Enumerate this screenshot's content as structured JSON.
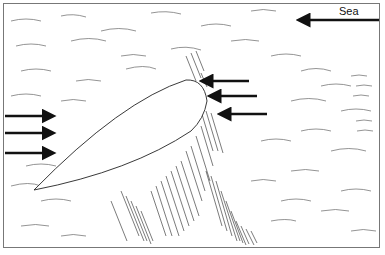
{
  "diagram": {
    "label": "Sea",
    "elements": [
      {
        "name": "hull",
        "shape": "streamlined bow outline, pointing upper-right"
      },
      {
        "name": "sea-arrow",
        "direction": "left",
        "position": "top-right"
      },
      {
        "name": "bow-arrows",
        "count": 3,
        "direction": "left",
        "position": "at bow"
      },
      {
        "name": "stern-arrows",
        "count": 3,
        "direction": "right",
        "position": "left edge"
      },
      {
        "name": "bow-wave",
        "shape": "dense hatched band along right side of hull"
      }
    ],
    "colors": {
      "ink": "#111111",
      "background": "#ffffff",
      "frame": "#777777"
    }
  }
}
